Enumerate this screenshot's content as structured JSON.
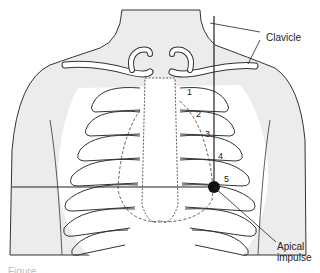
{
  "figure": {
    "labels": {
      "clavicle": "Clavicle",
      "apical_impulse_line1": "Apical",
      "apical_impulse_line2": "impulse"
    },
    "intercostal_spaces": [
      "1",
      "2",
      "3",
      "4",
      "5"
    ],
    "caption_fragment": "Figure"
  },
  "colors": {
    "skin_fill": "#ececec",
    "line": "#333333",
    "marker": "#111111"
  }
}
